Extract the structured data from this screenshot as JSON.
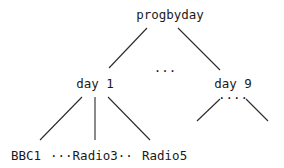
{
  "tree": {
    "root": {
      "label": "progbyday"
    },
    "middle_ellipsis": "...",
    "children": [
      {
        "label": "day 1",
        "leaves_text": [
          {
            "label": "BBC1"
          },
          {
            "label": "···Radio3··"
          },
          {
            "label": "Radio5"
          }
        ]
      },
      {
        "label": "day 9",
        "leaves_ellipsis": "····"
      }
    ]
  }
}
